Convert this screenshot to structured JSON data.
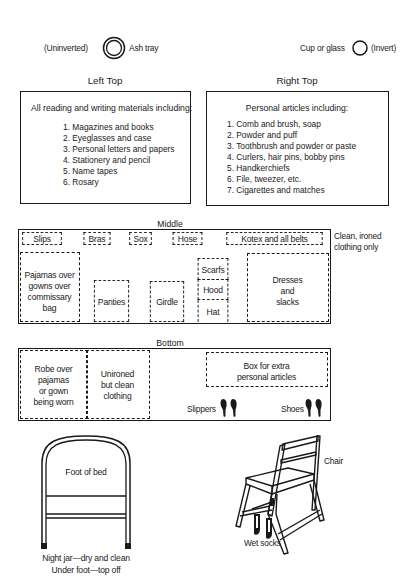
{
  "top_items": {
    "ash_tray": {
      "prefix": "(Uninverted)",
      "label": "Ash tray"
    },
    "cup": {
      "label": "Cup or glass",
      "suffix": "(Invert)"
    }
  },
  "left_top": {
    "title": "Left Top",
    "heading": "All reading and writing materials including:",
    "items": [
      "1. Magazines and books",
      "2. Eyeglasses and case",
      "3. Personal letters and papers",
      "4. Stationery and pencil",
      "5. Name tapes",
      "6. Rosary"
    ]
  },
  "right_top": {
    "title": "Right Top",
    "heading": "Personal articles including:",
    "items": [
      "1. Comb and brush, soap",
      "2. Powder and puff",
      "3. Toothbrush and powder or paste",
      "4. Curlers, hair pins, bobby pins",
      "5. Handkerchiefs",
      "6. File, tweezer, etc.",
      "7. Cigarettes and matches"
    ]
  },
  "middle": {
    "title": "Middle",
    "note_line1": "Clean, ironed",
    "note_line2": "clothing only",
    "compartments": {
      "slips": "Slips",
      "bras": "Bras",
      "sox": "Sox",
      "hose": "Hose",
      "kotex": "Kotex and all belts",
      "pajamas": [
        "Pajamas over",
        "gowns over",
        "commissary",
        "bag"
      ],
      "panties": "Panties",
      "girdle": "Girdle",
      "scarfs": "Scarfs",
      "hood": "Hood",
      "hat": "Hat",
      "dresses": [
        "Dresses",
        "and",
        "slacks"
      ]
    }
  },
  "bottom": {
    "title": "Bottom",
    "compartments": {
      "robe": [
        "Robe over",
        "pajamas",
        "or gown",
        "being worn"
      ],
      "unironed": [
        "Unironed",
        "but clean",
        "clothing"
      ],
      "box": [
        "Box for extra",
        "personal articles"
      ],
      "slippers": "Slippers",
      "shoes": "Shoes"
    }
  },
  "bed": {
    "label": "Foot of bed",
    "caption_line1": "Night jar—dry and clean",
    "caption_line2": "Under foot—top off"
  },
  "chair": {
    "label": "Chair",
    "socks_label": "Wet socks"
  }
}
